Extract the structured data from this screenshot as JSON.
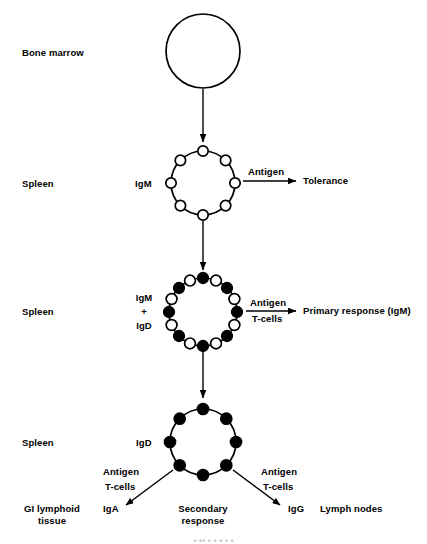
{
  "diagram": {
    "stroke_color": "#000000",
    "fill_open": "#ffffff",
    "fill_closed": "#000000",
    "background": "#ffffff"
  },
  "stages": [
    {
      "id": "bone-marrow",
      "site_label": "Bone marrow",
      "receptor_label": "",
      "receptor_count": 0,
      "receptor_pattern": "none",
      "cell_radius": 37
    },
    {
      "id": "spleen-igm",
      "site_label": "Spleen",
      "receptor_label": "IgM",
      "receptor_count": 8,
      "receptor_pattern": "open",
      "cell_radius": 32,
      "signal_label": "Antigen",
      "outcome_label": "Tolerance"
    },
    {
      "id": "spleen-igm-igd",
      "site_label": "Spleen",
      "receptor_label_lines": [
        "IgM",
        "+",
        "IgD"
      ],
      "receptor_count": 16,
      "receptor_pattern": "alternating",
      "cell_radius": 34,
      "signal_label_top": "Antigen",
      "signal_label_bottom": "T-cells",
      "outcome_label": "Primary response (IgM)"
    },
    {
      "id": "spleen-igd",
      "site_label": "Spleen",
      "receptor_label": "IgD",
      "receptor_count": 8,
      "receptor_pattern": "closed",
      "cell_radius": 33,
      "branch_center_lines": [
        "Secondary",
        "response"
      ],
      "branches": [
        {
          "side": "left",
          "signal_label_top": "Antigen",
          "signal_label_bottom": "T-cells",
          "antibody_label": "IgA",
          "tissue_label_lines": [
            "GI lymphoid",
            "tissue"
          ]
        },
        {
          "side": "right",
          "signal_label_top": "Antigen",
          "signal_label_bottom": "T-cells",
          "antibody_label": "IgG",
          "tissue_label": "Lymph nodes"
        }
      ]
    }
  ],
  "labels": {
    "bone_marrow": "Bone marrow",
    "spleen_1": "Spleen",
    "spleen_2": "Spleen",
    "spleen_3": "Spleen",
    "igm": "IgM",
    "igm_plus_1": "IgM",
    "igm_plus_sign": "+",
    "igm_plus_2": "IgD",
    "igd": "IgD",
    "antigen_1": "Antigen",
    "antigen_2": "Antigen",
    "tcells_2": "T-cells",
    "antigen_left": "Antigen",
    "tcells_left": "T-cells",
    "antigen_right": "Antigen",
    "tcells_right": "T-cells",
    "tolerance": "Tolerance",
    "primary_response": "Primary response (IgM)",
    "secondary_1": "Secondary",
    "secondary_2": "response",
    "iga": "IgA",
    "igg": "IgG",
    "gi_lymphoid_1": "GI lymphoid",
    "gi_lymphoid_2": "tissue",
    "lymph_nodes": "Lymph nodes",
    "page_footer_cropped": "•   ••        •   •   •   •   •"
  }
}
